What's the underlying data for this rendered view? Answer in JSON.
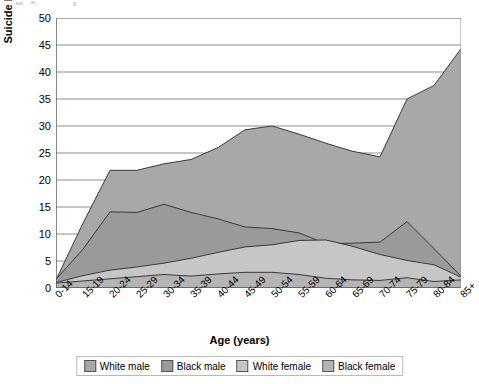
{
  "chart_data": {
    "type": "area",
    "stacked": false,
    "title": "",
    "xlabel": "Age (years)",
    "ylabel": "Suicide Rate per 100,000K",
    "ylim": [
      0,
      50
    ],
    "ytick_step": 5,
    "yticks": [
      0,
      5,
      10,
      15,
      20,
      25,
      30,
      35,
      40,
      45,
      50
    ],
    "grid": true,
    "legend_position": "bottom",
    "categories": [
      "0-14",
      "15-19",
      "20-24",
      "25-29",
      "30-34",
      "35-39",
      "40-44",
      "45-49",
      "50-54",
      "55-59",
      "60-64",
      "65-69",
      "70-74",
      "75-79",
      "80-84",
      "85+"
    ],
    "series": [
      {
        "name": "White male",
        "color": "#a8a8a8",
        "values": [
          1.5,
          12.0,
          21.8,
          21.8,
          23.0,
          23.8,
          26.0,
          29.3,
          30.0,
          28.5,
          26.8,
          25.3,
          24.3,
          35.0,
          37.5,
          44.3
        ]
      },
      {
        "name": "Black male",
        "color": "#9a9a9a",
        "values": [
          1.6,
          7.2,
          14.1,
          14.0,
          15.5,
          14.0,
          12.8,
          11.3,
          11.0,
          10.2,
          8.2,
          8.3,
          8.5,
          12.3,
          7.3,
          2.2
        ]
      },
      {
        "name": "White female",
        "color": "#c6c6c6",
        "values": [
          1.0,
          2.3,
          3.3,
          3.9,
          4.6,
          5.5,
          6.6,
          7.6,
          8.0,
          8.8,
          8.9,
          7.7,
          6.2,
          5.1,
          4.3,
          2.0
        ]
      },
      {
        "name": "Black female",
        "color": "#b4b4b4",
        "values": [
          0.9,
          1.3,
          1.7,
          2.1,
          2.5,
          2.2,
          2.6,
          2.9,
          2.9,
          2.5,
          1.8,
          1.5,
          1.4,
          1.9,
          1.2,
          1.5
        ]
      }
    ]
  },
  "axes": {
    "y_title": "Suicide Rate per 100,000K",
    "x_title": "Age (years)"
  },
  "legend": {
    "items": [
      {
        "label": "White male",
        "color": "#a8a8a8"
      },
      {
        "label": "Black male",
        "color": "#9a9a9a"
      },
      {
        "label": "White female",
        "color": "#c6c6c6"
      },
      {
        "label": "Black female",
        "color": "#b4b4b4"
      }
    ]
  }
}
